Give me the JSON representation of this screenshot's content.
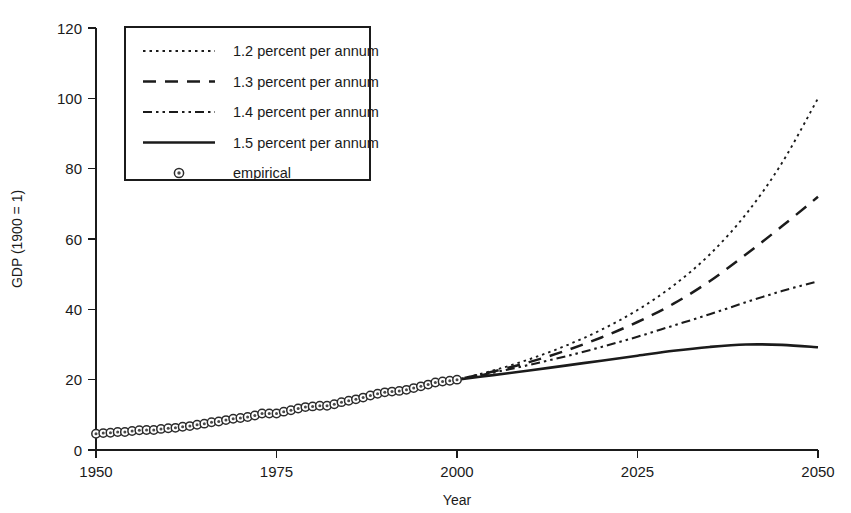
{
  "chart_data": {
    "type": "line",
    "title": "",
    "xlabel": "Year",
    "ylabel": "GDP (1900 = 1)",
    "xlim": [
      1950,
      2050
    ],
    "ylim": [
      0,
      120
    ],
    "xticks": [
      1950,
      1975,
      2000,
      2025,
      2050
    ],
    "yticks": [
      0,
      20,
      40,
      60,
      80,
      100,
      120
    ],
    "grid": false,
    "legend_position": "top-left",
    "series": [
      {
        "name": "1.2 percent per annum",
        "style": "dotted",
        "x": [
          2000,
          2005,
          2010,
          2015,
          2020,
          2025,
          2030,
          2035,
          2040,
          2045,
          2050
        ],
        "values": [
          20.0,
          22.6,
          25.8,
          29.6,
          34.2,
          39.8,
          46.8,
          55.6,
          67.0,
          81.6,
          100.0
        ]
      },
      {
        "name": "1.3 percent per annum",
        "style": "dashed",
        "x": [
          2000,
          2005,
          2010,
          2015,
          2020,
          2025,
          2030,
          2035,
          2040,
          2045,
          2050
        ],
        "values": [
          20.0,
          22.3,
          25.0,
          28.2,
          32.0,
          36.4,
          41.6,
          48.0,
          55.6,
          63.6,
          72.0
        ]
      },
      {
        "name": "1.4 percent per annum",
        "style": "dashdotdot",
        "x": [
          2000,
          2005,
          2010,
          2015,
          2020,
          2025,
          2030,
          2035,
          2040,
          2045,
          2050
        ],
        "values": [
          20.0,
          22.0,
          24.2,
          26.6,
          29.3,
          32.2,
          35.4,
          38.6,
          42.0,
          45.2,
          48.0
        ]
      },
      {
        "name": "1.5 percent per annum",
        "style": "solid",
        "x": [
          2000,
          2005,
          2010,
          2015,
          2020,
          2025,
          2030,
          2035,
          2040,
          2045,
          2050
        ],
        "values": [
          20.0,
          21.3,
          22.6,
          24.0,
          25.4,
          26.8,
          28.2,
          29.3,
          30.0,
          29.9,
          29.2
        ]
      },
      {
        "name": "empirical",
        "style": "markers",
        "x": [
          1950,
          1951,
          1952,
          1953,
          1954,
          1955,
          1956,
          1957,
          1958,
          1959,
          1960,
          1961,
          1962,
          1963,
          1964,
          1965,
          1966,
          1967,
          1968,
          1969,
          1970,
          1971,
          1972,
          1973,
          1974,
          1975,
          1976,
          1977,
          1978,
          1979,
          1980,
          1981,
          1982,
          1983,
          1984,
          1985,
          1986,
          1987,
          1988,
          1989,
          1990,
          1991,
          1992,
          1993,
          1994,
          1995,
          1996,
          1997,
          1998,
          1999,
          2000
        ],
        "values": [
          4.6,
          4.8,
          4.9,
          5.1,
          5.1,
          5.4,
          5.6,
          5.7,
          5.7,
          6.0,
          6.2,
          6.3,
          6.6,
          6.8,
          7.2,
          7.5,
          7.9,
          8.1,
          8.5,
          8.9,
          9.1,
          9.4,
          9.8,
          10.4,
          10.4,
          10.4,
          10.9,
          11.3,
          11.8,
          12.2,
          12.4,
          12.6,
          12.6,
          13.0,
          13.6,
          14.0,
          14.4,
          14.9,
          15.5,
          16.0,
          16.4,
          16.6,
          16.8,
          17.1,
          17.6,
          18.1,
          18.6,
          19.2,
          19.5,
          19.7,
          20.0
        ]
      }
    ]
  },
  "legend": {
    "entries": [
      {
        "label": "1.2 percent per annum",
        "style": "dotted"
      },
      {
        "label": "1.3 percent per annum",
        "style": "dashed"
      },
      {
        "label": "1.4 percent per annum",
        "style": "dashdotdot"
      },
      {
        "label": "1.5 percent per annum",
        "style": "solid"
      },
      {
        "label": "empirical",
        "style": "markers"
      }
    ]
  },
  "colors": {
    "line": "#1b1b1b",
    "background": "#ffffff",
    "marker_fill": "#ffffff",
    "marker_core": "#4a4a4a"
  }
}
